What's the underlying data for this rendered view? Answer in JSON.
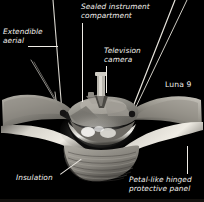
{
  "figure": {
    "caption_id": "Luna 9",
    "background_color": "#000000",
    "label_color": "#f2f0ec"
  },
  "labels": {
    "extendible_aerial": "Extendible\naerial",
    "sealed_instrument_compartment": "Sealed instrument\ncompartment",
    "television_camera": "Television\ncamera",
    "spacecraft_name": "Luna 9",
    "insulation": "Insulation",
    "petal_panel": "Petal-like hinged\nprotective panel"
  },
  "leader_lines": {
    "extendible_aerial": "horizontal-rule-right-of-text",
    "sealed_instrument_compartment": "vertical-rule-down-to-body",
    "television_camera": "vertical-rule-down-to-camera-mast",
    "insulation": "diagonal-rule-up-right-to-skirt",
    "petal_panel": "vertical-rule-up-to-petal-tip"
  },
  "spacecraft_parts": {
    "camera_mast": "television-camera-cylinder",
    "dome": "sealed-instrument-compartment-dome",
    "petals": [
      "left-petal",
      "left-lower-petal",
      "right-petal",
      "right-lower-petal"
    ],
    "aerials": [
      "aerial-left-outer",
      "aerial-left-inner",
      "aerial-left-mid",
      "aerial-right-inner",
      "aerial-right-outer"
    ],
    "skirt": "insulation-ribbed-skirt"
  }
}
